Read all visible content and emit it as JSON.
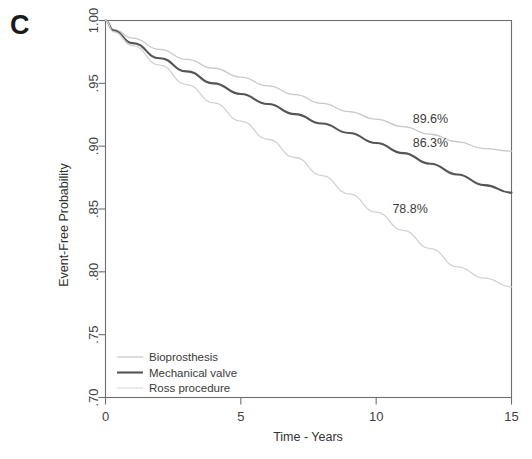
{
  "panel": {
    "letter": "C"
  },
  "chart_data": {
    "type": "line",
    "title": "",
    "xlabel": "Time - Years",
    "ylabel": "Event-Free Probability",
    "xlim": [
      0,
      15
    ],
    "ylim": [
      0.7,
      1.0
    ],
    "grid": false,
    "legend_position": "bottom-left",
    "x_ticks": [
      {
        "value": 0,
        "label": "0"
      },
      {
        "value": 5,
        "label": "5"
      },
      {
        "value": 10,
        "label": "10"
      },
      {
        "value": 15,
        "label": "15"
      }
    ],
    "y_ticks": [
      {
        "value": 1.0,
        "label": "1.00"
      },
      {
        "value": 0.95,
        "label": ".95"
      },
      {
        "value": 0.9,
        "label": ".90"
      },
      {
        "value": 0.85,
        "label": ".85"
      },
      {
        "value": 0.8,
        "label": ".80"
      },
      {
        "value": 0.75,
        "label": ".75"
      },
      {
        "value": 0.7,
        "label": ".70"
      }
    ],
    "series": [
      {
        "name": "Bioprosthesis",
        "color": "#c9c9c9",
        "width": 1.3,
        "endpoint_label": "89.6%",
        "endpoint_value": 0.896,
        "x": [
          0,
          0.3,
          1,
          2,
          3,
          4,
          5,
          6,
          7,
          8,
          9,
          10,
          11,
          12,
          13,
          14,
          15
        ],
        "y": [
          1.0,
          0.993,
          0.986,
          0.977,
          0.969,
          0.962,
          0.955,
          0.948,
          0.941,
          0.934,
          0.9275,
          0.9215,
          0.9155,
          0.9095,
          0.9035,
          0.898,
          0.896
        ]
      },
      {
        "name": "Mechanical valve",
        "color": "#555555",
        "width": 2.1,
        "endpoint_label": "86.3%",
        "endpoint_value": 0.863,
        "x": [
          0,
          0.3,
          1,
          2,
          3,
          4,
          5,
          6,
          7,
          8,
          9,
          10,
          11,
          12,
          13,
          14,
          15
        ],
        "y": [
          1.0,
          0.992,
          0.982,
          0.97,
          0.9595,
          0.95,
          0.9415,
          0.9335,
          0.9255,
          0.918,
          0.9105,
          0.9025,
          0.8945,
          0.886,
          0.8775,
          0.869,
          0.863
        ]
      },
      {
        "name": "Ross procedure",
        "color": "#d2d2d2",
        "width": 1.3,
        "endpoint_label": "78.8%",
        "endpoint_value": 0.788,
        "x": [
          0,
          0.3,
          1,
          2,
          3,
          4,
          5,
          6,
          7,
          8,
          9,
          10,
          11,
          12,
          13,
          14,
          15
        ],
        "y": [
          1.0,
          0.991,
          0.98,
          0.9645,
          0.949,
          0.9345,
          0.92,
          0.9055,
          0.891,
          0.8765,
          0.862,
          0.8475,
          0.833,
          0.8185,
          0.804,
          0.795,
          0.788
        ]
      }
    ],
    "annotations": [
      {
        "text": "89.6%",
        "x": 11.35,
        "y": 0.9185
      },
      {
        "text": "86.3%",
        "x": 11.35,
        "y": 0.8995
      },
      {
        "text": "78.8%",
        "x": 10.6,
        "y": 0.8465
      }
    ],
    "legend": [
      {
        "label": "Bioprosthesis",
        "color": "#c9c9c9",
        "width": 1.3
      },
      {
        "label": "Mechanical valve",
        "color": "#555555",
        "width": 2.1
      },
      {
        "label": "Ross procedure",
        "color": "#d8d8d8",
        "width": 1.1
      }
    ]
  }
}
